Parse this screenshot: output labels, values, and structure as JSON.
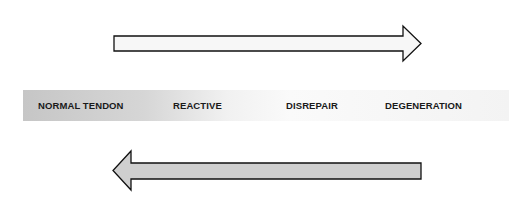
{
  "diagram": {
    "type": "tendon-continuum",
    "stages": [
      {
        "label": "NORMAL TENDON",
        "x": 38
      },
      {
        "label": "REACTIVE",
        "x": 173
      },
      {
        "label": "DISREPAIR",
        "x": 286
      },
      {
        "label": "DEGENERATION",
        "x": 385
      }
    ],
    "arrows": [
      {
        "direction": "right",
        "meaning": "progression",
        "fill": "#f7f7f7",
        "stroke": "#111111"
      },
      {
        "direction": "left",
        "meaning": "regression",
        "fill": "#cfcfcf",
        "stroke": "#111111"
      }
    ],
    "band": {
      "gradient_start": "#c6c6c6",
      "gradient_end": "#f3f3f3"
    }
  }
}
